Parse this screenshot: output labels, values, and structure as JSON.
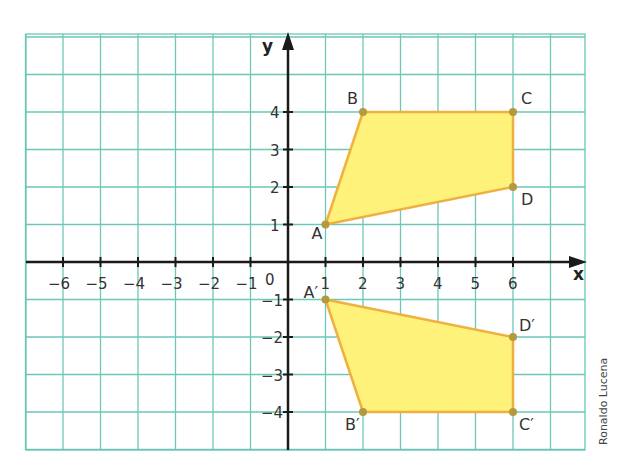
{
  "chart_data": {
    "type": "scatter",
    "title": "",
    "xlabel": "x",
    "ylabel": "y",
    "xlim": [
      -7,
      8
    ],
    "ylim": [
      -5,
      6
    ],
    "grid": true,
    "x_ticks": [
      "-6",
      "-5",
      "-4",
      "-3",
      "-2",
      "-1",
      "1",
      "2",
      "3",
      "4",
      "5",
      "6"
    ],
    "y_ticks": [
      "4",
      "3",
      "2",
      "1",
      "-1",
      "-2",
      "-3",
      "-4"
    ],
    "origin_label": "0",
    "series": [
      {
        "name": "ABCD",
        "points": [
          {
            "label": "A",
            "x": 1,
            "y": 1
          },
          {
            "label": "B",
            "x": 2,
            "y": 4
          },
          {
            "label": "C",
            "x": 6,
            "y": 4
          },
          {
            "label": "D",
            "x": 6,
            "y": 2
          }
        ]
      },
      {
        "name": "A'B'C'D'",
        "points": [
          {
            "label": "A'",
            "x": 1,
            "y": -1
          },
          {
            "label": "B'",
            "x": 2,
            "y": -4
          },
          {
            "label": "C'",
            "x": 6,
            "y": -4
          },
          {
            "label": "D'",
            "x": 6,
            "y": -2
          }
        ]
      }
    ],
    "colors": {
      "grid": "#6cc7b8",
      "fill": "#fff27a",
      "stroke": "#f0b040",
      "point": "#b39a3e",
      "axis": "#1a1a1a"
    }
  },
  "credit": "Ronaldo Lucena"
}
